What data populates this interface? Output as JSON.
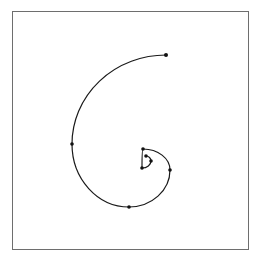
{
  "diagram": {
    "type": "logarithmic-spiral",
    "frame": {
      "x": 12,
      "y": 11,
      "width": 237,
      "height": 239,
      "color": "#6e6e6e"
    },
    "curve_color": "#1a1a1a",
    "dot_color": "#111111",
    "points": [
      {
        "x": 166,
        "y": 55
      },
      {
        "x": 72,
        "y": 144
      },
      {
        "x": 129,
        "y": 207
      },
      {
        "x": 170,
        "y": 170
      },
      {
        "x": 143,
        "y": 149
      },
      {
        "x": 142,
        "y": 168
      },
      {
        "x": 151,
        "y": 161
      },
      {
        "x": 146,
        "y": 156
      }
    ]
  }
}
